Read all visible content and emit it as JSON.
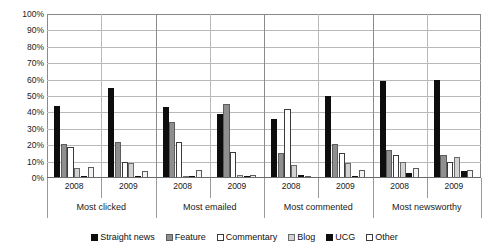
{
  "chart_data": {
    "type": "bar",
    "title": "",
    "subtitle": "",
    "xlabel": "",
    "ylabel": "",
    "ylim": [
      0,
      100
    ],
    "ytick_labels": [
      "100%",
      "90%",
      "80%",
      "70%",
      "60%",
      "50%",
      "40%",
      "30%",
      "20%",
      "10%",
      "0%"
    ],
    "ytick_values": [
      100,
      90,
      80,
      70,
      60,
      50,
      40,
      30,
      20,
      10,
      0
    ],
    "grid": true,
    "legend_position": "bottom",
    "group_labels": [
      "Most clicked",
      "Most emailed",
      "Most commented",
      "Most newsworthy"
    ],
    "categories": [
      "2008",
      "2009",
      "2008",
      "2009",
      "2008",
      "2009",
      "2008",
      "2009"
    ],
    "series": [
      {
        "name": "Straight news",
        "color": "#0d0d0d",
        "values": [
          44,
          55,
          43,
          39,
          36,
          50,
          59,
          60
        ]
      },
      {
        "name": "Feature",
        "color": "#8f8f8f",
        "values": [
          21,
          22,
          34,
          45,
          15,
          21,
          17,
          14
        ]
      },
      {
        "name": "Commentary",
        "color": "#ffffff",
        "values": [
          19,
          10,
          22,
          16,
          42,
          15,
          14,
          10
        ]
      },
      {
        "name": "Blog",
        "color": "#d2d2d2",
        "values": [
          6,
          9,
          1,
          2,
          8,
          9,
          10,
          13
        ]
      },
      {
        "name": "UCG",
        "color": "#101010",
        "values": [
          1,
          1,
          1,
          1,
          2,
          1,
          3,
          4
        ]
      },
      {
        "name": "Other",
        "color": "#f2f2f2",
        "values": [
          7,
          4,
          5,
          2,
          1,
          5,
          6,
          5
        ]
      }
    ]
  },
  "legend": {
    "items": [
      {
        "label": "Straight news",
        "swatch": "black"
      },
      {
        "label": "Feature",
        "swatch": "gray"
      },
      {
        "label": "Commentary",
        "swatch": "white"
      },
      {
        "label": "Blog",
        "swatch": "lightgray"
      },
      {
        "label": "UCG",
        "swatch": "black"
      },
      {
        "label": "Other",
        "swatch": "white"
      }
    ]
  }
}
